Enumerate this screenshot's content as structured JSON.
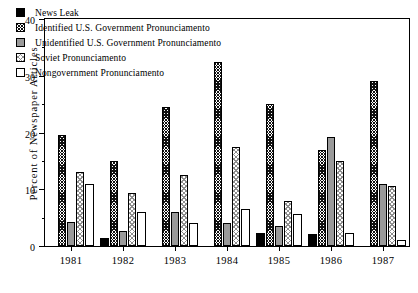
{
  "chart_data": {
    "type": "bar",
    "title": "",
    "xlabel": "",
    "ylabel": "Percent of Newspaper Articles",
    "ylim": [
      0,
      40
    ],
    "ytick_labels": [
      "0",
      "10",
      "20",
      "30",
      "40"
    ],
    "ytick_values": [
      0,
      10,
      20,
      30,
      40
    ],
    "yminor_values": [
      5,
      15,
      25,
      35
    ],
    "grid": false,
    "legend_position": "top-left",
    "categories": [
      "1981",
      "1982",
      "1983",
      "1984",
      "1985",
      "1986",
      "1987"
    ],
    "series": [
      {
        "name": "News Leak",
        "pattern": "solid-black",
        "values": [
          0,
          1.5,
          0,
          0,
          2.3,
          2.2,
          0
        ]
      },
      {
        "name": "Identified U.S. Government Pronunciamento",
        "pattern": "dark-hatch",
        "values": [
          19.5,
          15,
          24.5,
          32.5,
          25,
          17,
          29
        ]
      },
      {
        "name": "Unidentified U.S. Government Pronunciamento",
        "pattern": "solid-gray",
        "values": [
          4.3,
          2.7,
          6,
          4,
          3.5,
          19.2,
          11
        ]
      },
      {
        "name": "Soviet Pronunciamento",
        "pattern": "light-hatch",
        "values": [
          13,
          9.3,
          12.5,
          17.5,
          8,
          15,
          10.5
        ]
      },
      {
        "name": "Nongovernment Pronunciamento",
        "pattern": "white",
        "values": [
          11,
          6,
          4,
          6.5,
          5.7,
          2.3,
          1
        ]
      }
    ]
  }
}
